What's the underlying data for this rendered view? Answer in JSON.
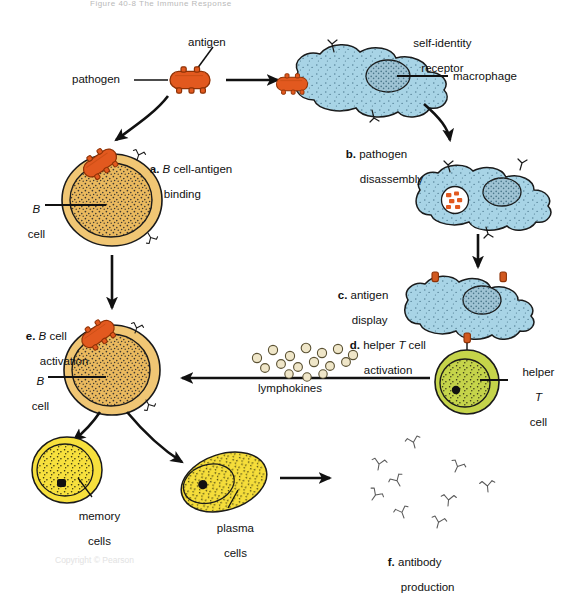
{
  "figure": {
    "title": "Figure 40-8    The Immune Response",
    "footer_note": "Copyright  ©  Pearson",
    "background_color": "#ffffff",
    "stroke_color": "#1a1a1a"
  },
  "palette": {
    "pathogen_orange": "#e2591f",
    "pathogen_orange_dark": "#c6430f",
    "macrophage_blue": "#a8d4e6",
    "macrophage_blue_dark": "#6fb4cf",
    "macrophage_nucleus": "#9fc3d4",
    "bcell_tan": "#f0c674",
    "bcell_tan_dark": "#d9a23e",
    "bcell_nucleus": "#eab95e",
    "tcell_green": "#c5d44a",
    "tcell_green_dark": "#9aab2e",
    "memory_yellow": "#f7e03d",
    "plasma_yellow": "#f5dd3a",
    "lymphokine_cream": "#efe6c8",
    "antibody_gray": "#555555"
  },
  "labels": {
    "pathogen": "pathogen",
    "antigen": "antigen",
    "self_identity_receptor": "self-identity\nreceptor",
    "macrophage": "macrophage",
    "b_cell_1_line1": "B",
    "b_cell_1_line2": "cell",
    "b_cell_2_line1": "B",
    "b_cell_2_line2": "cell",
    "helper_t_cell_line1": "helper",
    "helper_t_cell_line2": "T",
    "helper_t_cell_line3": "cell",
    "lymphokines": "lymphokines",
    "memory_cells_line1": "memory",
    "memory_cells_line2": "cells",
    "plasma_cells_line1": "plasma",
    "plasma_cells_line2": "cells"
  },
  "steps": [
    {
      "key": "a",
      "marker": "a.",
      "text_1": "B",
      "text_2": " cell-antigen",
      "text_3": "binding"
    },
    {
      "key": "b",
      "marker": "b.",
      "text_1": "pathogen",
      "text_2": "disassembly"
    },
    {
      "key": "c",
      "marker": "c.",
      "text_1": "antigen",
      "text_2": "display"
    },
    {
      "key": "d",
      "marker": "d.",
      "text_1": "helper ",
      "text_2": "T",
      "text_3": " cell",
      "text_4": "activation"
    },
    {
      "key": "e",
      "marker": "e.",
      "text_1": "B",
      "text_2": " cell",
      "text_3": "activation"
    },
    {
      "key": "f",
      "marker": "f.",
      "text_1": "antibody",
      "text_2": "production"
    }
  ],
  "counts": {
    "lymphokine_particles": 16,
    "antibody_molecules": 9
  }
}
